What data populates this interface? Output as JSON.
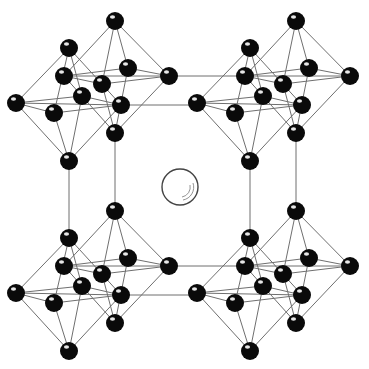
{
  "diagram": {
    "type": "crystal-structure",
    "colors": {
      "background": "#ffffff",
      "atom": "#0a0a0a",
      "bond": "#6f6f6f",
      "cation_outline": "#444444"
    },
    "atom_radius": 9,
    "cluster_template": {
      "octahedron_back": {
        "top": [
          115,
          21
        ],
        "bottom": [
          115,
          133
        ],
        "equator": [
          [
            64,
            76
          ],
          [
            128,
            68
          ],
          [
            169,
            76
          ],
          [
            102,
            84
          ]
        ]
      },
      "octahedron_front": {
        "top": [
          69,
          48
        ],
        "bottom": [
          69,
          161
        ],
        "equator": [
          [
            16,
            103
          ],
          [
            82,
            96
          ],
          [
            121,
            105
          ],
          [
            54,
            113
          ]
        ]
      }
    },
    "clusters": [
      {
        "name": "top-left",
        "dx": 0,
        "dy": 0
      },
      {
        "name": "top-right",
        "dx": 181,
        "dy": 0
      },
      {
        "name": "bottom-left",
        "dx": 0,
        "dy": 190
      },
      {
        "name": "bottom-right",
        "dx": 181,
        "dy": 190
      }
    ],
    "cell_edges": [
      [
        [
          169,
          76
        ],
        [
          245,
          76
        ]
      ],
      [
        [
          121,
          105
        ],
        [
          197,
          105
        ]
      ],
      [
        [
          169,
          266
        ],
        [
          245,
          266
        ]
      ],
      [
        [
          121,
          295
        ],
        [
          197,
          295
        ]
      ],
      [
        [
          69,
          161
        ],
        [
          69,
          238
        ]
      ],
      [
        [
          115,
          133
        ],
        [
          115,
          211
        ]
      ],
      [
        [
          250,
          161
        ],
        [
          250,
          238
        ]
      ],
      [
        [
          296,
          133
        ],
        [
          296,
          211
        ]
      ]
    ],
    "central_cation": {
      "cx": 180,
      "cy": 187,
      "r": 18
    }
  }
}
